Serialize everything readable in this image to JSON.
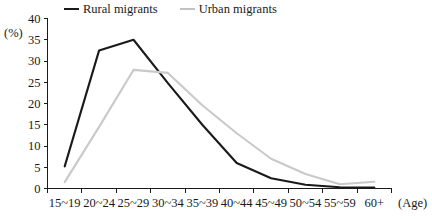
{
  "legend": {
    "entries": [
      {
        "label": "Rural migrants",
        "color": "#1a1a1a",
        "key": "rural"
      },
      {
        "label": "Urban migrants",
        "color": "#c9c9c9",
        "key": "urban"
      }
    ]
  },
  "axes": {
    "y_unit_label": "(%)",
    "x_caption": "(Age)"
  },
  "chart_data": {
    "type": "line",
    "title": "",
    "xlabel": "(Age)",
    "ylabel": "(%)",
    "categories": [
      "15~19",
      "20~24",
      "25~29",
      "30~34",
      "35~39",
      "40~44",
      "45~49",
      "50~54",
      "55~59",
      "60+"
    ],
    "ylim": [
      0,
      40
    ],
    "yticks": [
      0,
      5,
      10,
      15,
      20,
      25,
      30,
      35,
      40
    ],
    "ytick_labels": [
      "0",
      "5",
      "10",
      "15",
      "20",
      "25",
      "30",
      "35",
      "40"
    ],
    "grid": false,
    "legend_position": "top",
    "series": [
      {
        "name": "Rural migrants",
        "color": "#1a1a1a",
        "values": [
          5.2,
          32.5,
          35.0,
          24.8,
          15.0,
          6.0,
          2.4,
          0.9,
          0.3,
          0.2
        ]
      },
      {
        "name": "Urban migrants",
        "color": "#c9c9c9",
        "values": [
          1.5,
          14.5,
          27.9,
          27.2,
          19.6,
          13.0,
          7.0,
          3.4,
          1.0,
          1.6
        ]
      }
    ]
  }
}
